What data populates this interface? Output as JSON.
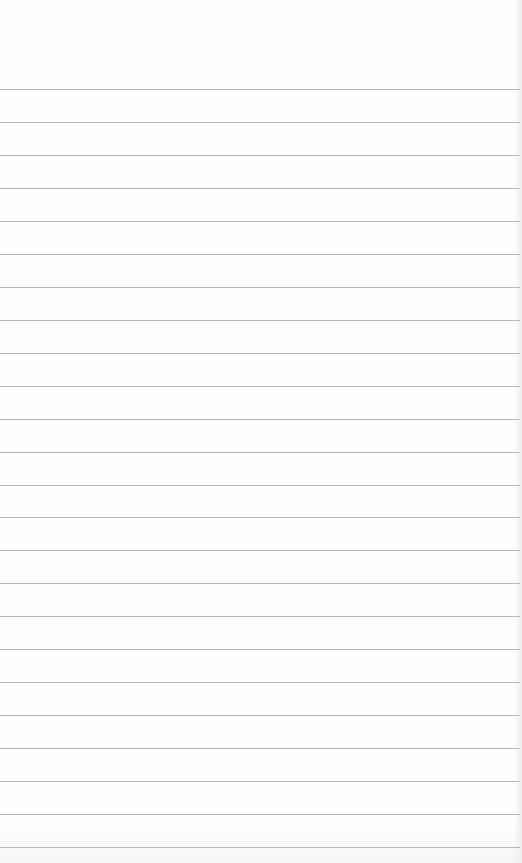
{
  "page": {
    "type": "lined-paper",
    "background_color": "#fefefe",
    "rule_color": "#b8b8b8",
    "rule_count": 24,
    "first_rule_y": 89,
    "rule_spacing_px": 32.96
  }
}
